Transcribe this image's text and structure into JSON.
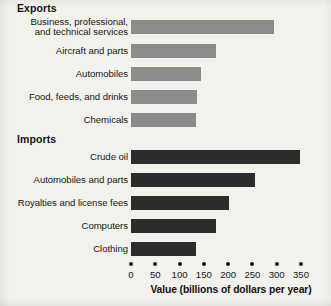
{
  "chart_data": {
    "type": "bar",
    "orientation": "horizontal",
    "title": "",
    "xlabel": "Value (billions of dollars per year)",
    "ylabel": "",
    "xlim": [
      0,
      350
    ],
    "xticks": [
      0,
      50,
      100,
      150,
      200,
      250,
      300,
      350
    ],
    "xtick_labels": [
      "0",
      "50",
      "100",
      "150",
      "200",
      "250",
      "300",
      "350"
    ],
    "grid": false,
    "legend": "none",
    "groups": [
      {
        "name": "Exports",
        "color": "#8b8b8b",
        "categories": [
          "Business, professional,\nand technical services",
          "Aircraft and parts",
          "Automobiles",
          "Food, feeds, and drinks",
          "Chemicals"
        ],
        "values": [
          294,
          175,
          144,
          135,
          133
        ]
      },
      {
        "name": "Imports",
        "color": "#2c2c2c",
        "categories": [
          "Crude oil",
          "Automobiles and parts",
          "Royalties and license fees",
          "Computers",
          "Clothing"
        ],
        "values": [
          347,
          256,
          202,
          175,
          133
        ]
      }
    ]
  },
  "headings": {
    "exports": "Exports",
    "imports": "Imports"
  },
  "axis": {
    "title": "Value (billions of dollars per year)",
    "ticks": [
      {
        "value": 0,
        "label": "0"
      },
      {
        "value": 50,
        "label": "50"
      },
      {
        "value": 100,
        "label": "100"
      },
      {
        "value": 150,
        "label": "150"
      },
      {
        "value": 200,
        "label": "200"
      },
      {
        "value": 250,
        "label": "250"
      },
      {
        "value": 300,
        "label": "300"
      },
      {
        "value": 350,
        "label": "350"
      }
    ]
  },
  "rows": {
    "exports": [
      {
        "label": "Business, professional,\nand technical services",
        "value": 294
      },
      {
        "label": "Aircraft and parts",
        "value": 175
      },
      {
        "label": "Automobiles",
        "value": 144
      },
      {
        "label": "Food, feeds, and drinks",
        "value": 135
      },
      {
        "label": "Chemicals",
        "value": 133
      }
    ],
    "imports": [
      {
        "label": "Crude oil",
        "value": 347
      },
      {
        "label": "Automobiles and parts",
        "value": 256
      },
      {
        "label": "Royalties and license fees",
        "value": 202
      },
      {
        "label": "Computers",
        "value": 175
      },
      {
        "label": "Clothing",
        "value": 133
      }
    ]
  },
  "colors": {
    "export_bar": "#8b8b8b",
    "import_bar": "#2c2c2c",
    "background": "#f2f1ec",
    "text": "#161616"
  }
}
